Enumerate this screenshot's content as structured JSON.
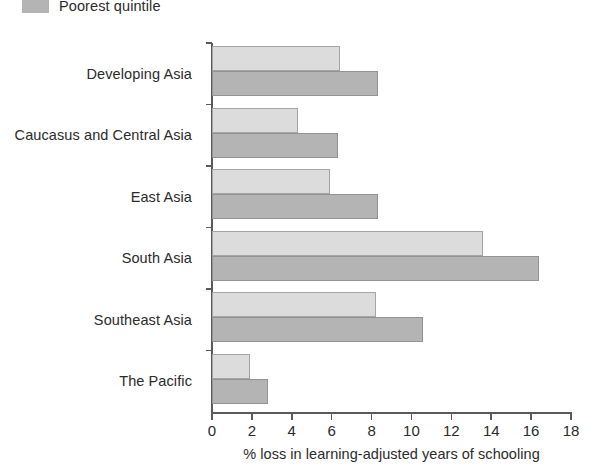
{
  "chart_data": {
    "type": "bar",
    "orientation": "horizontal",
    "title": "",
    "xlabel": "% loss in learning-adjusted years of schooling",
    "ylabel": "",
    "xlim": [
      0,
      18
    ],
    "xticks": [
      0,
      2,
      4,
      6,
      8,
      10,
      12,
      14,
      16,
      18
    ],
    "grid": false,
    "legend_position": "top-left",
    "categories": [
      "Developing Asia",
      "Caucasus and Central Asia",
      "East Asia",
      "South Asia",
      "Southeast Asia",
      "The Pacific"
    ],
    "series": [
      {
        "name": "",
        "color": "#dcdcdc",
        "values": [
          6.4,
          4.3,
          5.9,
          13.6,
          8.2,
          1.9
        ]
      },
      {
        "name": "Poorest quintile",
        "color": "#b4b4b4",
        "values": [
          8.3,
          6.3,
          8.3,
          16.4,
          10.6,
          2.8
        ]
      }
    ]
  },
  "legend": {
    "entries": [
      {
        "label": "Poorest quintile",
        "color": "#b4b4b4"
      }
    ]
  },
  "axis": {
    "tick_labels": [
      "0",
      "2",
      "4",
      "6",
      "8",
      "10",
      "12",
      "14",
      "16",
      "18"
    ],
    "title": "% loss in learning-adjusted years of schooling"
  }
}
